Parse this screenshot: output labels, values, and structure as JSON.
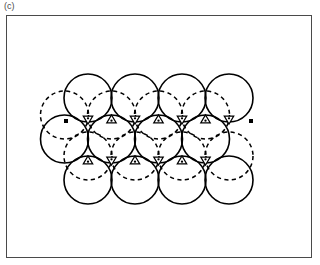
{
  "panel": {
    "label": "(c)"
  },
  "figure": {
    "title": "(c)",
    "kind": "close-packed-layer-diagram",
    "frame": {
      "x": 6,
      "y": 15,
      "width": 306,
      "height": 243,
      "stroke": "#4a4a4a",
      "stroke_width": 1
    },
    "colors": {
      "sphere_stroke": "#000000",
      "dashed_stroke": "#000000",
      "void_fill": "#ffffff",
      "void_stroke": "#000000",
      "dot_fill": "#000000",
      "frame_stroke": "#4a4a4a",
      "background": "#ffffff",
      "label_color": "#4a4a4a"
    },
    "geometry": {
      "radius": 24,
      "spacing_x": 47,
      "row_offset_x": 23.5,
      "row_spacing_y": 41,
      "dash_pattern": "4.2 3.4"
    }
  },
  "chart_data": {
    "type": "scatter",
    "title": "(c)",
    "xlabel": "",
    "ylabel": "",
    "xlim": [
      6,
      312
    ],
    "ylim": [
      15,
      258
    ],
    "grid": false,
    "legend": null,
    "series": [
      {
        "name": "solid-spheres-row-top",
        "style": "solid-circle",
        "radius": 24,
        "x": [
          88,
          135,
          182,
          229
        ],
        "y": [
          98,
          98,
          98,
          98
        ]
      },
      {
        "name": "solid-spheres-row-middle",
        "style": "solid-circle",
        "radius": 24,
        "x": [
          111.5,
          158.5,
          205.5,
          64.5
        ],
        "y": [
          139,
          139,
          139,
          139
        ]
      },
      {
        "name": "solid-spheres-row-bottom",
        "style": "solid-circle",
        "radius": 24,
        "x": [
          88,
          135,
          182,
          229
        ],
        "y": [
          180,
          180,
          180,
          180
        ]
      },
      {
        "name": "dashed-spheres-upper-band",
        "style": "dashed-circle",
        "radius": 24,
        "x": [
          111.5,
          158.5,
          205.5,
          64.5
        ],
        "y": [
          115,
          115,
          115,
          115
        ]
      },
      {
        "name": "dashed-spheres-lower-band",
        "style": "dashed-circle",
        "radius": 24,
        "x": [
          88,
          135,
          182,
          229
        ],
        "y": [
          156,
          156,
          156,
          156
        ]
      }
    ],
    "markers": [
      {
        "name": "triangular-void",
        "shape": "triangle",
        "points": [
          {
            "x": 111.5,
            "y": 119.5,
            "orient": "up"
          },
          {
            "x": 158.5,
            "y": 119.5,
            "orient": "up"
          },
          {
            "x": 205.5,
            "y": 119.5,
            "orient": "up"
          },
          {
            "x": 88,
            "y": 119.5,
            "orient": "down"
          },
          {
            "x": 135,
            "y": 119.5,
            "orient": "down"
          },
          {
            "x": 182,
            "y": 119.5,
            "orient": "down"
          },
          {
            "x": 229,
            "y": 119.5,
            "orient": "down"
          },
          {
            "x": 88,
            "y": 160.5,
            "orient": "up"
          },
          {
            "x": 135,
            "y": 160.5,
            "orient": "up"
          },
          {
            "x": 182,
            "y": 160.5,
            "orient": "up"
          },
          {
            "x": 111.5,
            "y": 160.5,
            "orient": "down"
          },
          {
            "x": 158.5,
            "y": 160.5,
            "orient": "down"
          },
          {
            "x": 205.5,
            "y": 160.5,
            "orient": "down"
          }
        ]
      },
      {
        "name": "edge-contact-dot",
        "shape": "square",
        "points": [
          {
            "x": 66,
            "y": 121
          },
          {
            "x": 251,
            "y": 121
          }
        ]
      }
    ],
    "counts": {
      "solid_circles": 12,
      "dashed_circles": 8,
      "triangular_voids": 13
    }
  }
}
